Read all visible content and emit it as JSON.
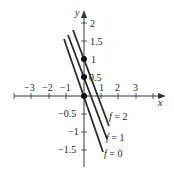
{
  "diagram": {
    "type": "level-curves",
    "axes": {
      "x_label": "x",
      "y_label": "y",
      "x_ticks": [
        "−3",
        "−2",
        "−1",
        "1",
        "2",
        "3"
      ],
      "y_ticks_pos": [
        "0.5",
        "1",
        "1.5",
        "2"
      ],
      "y_ticks_neg": [
        "−0.5",
        "−1",
        "−1.5"
      ]
    },
    "curves": [
      {
        "label_var": "f",
        "label_eq": " = 0"
      },
      {
        "label_var": "f",
        "label_eq": " = 1"
      },
      {
        "label_var": "f",
        "label_eq": " = 2"
      }
    ],
    "points": [
      {
        "x": 0,
        "y": 0
      },
      {
        "x": 0,
        "y": 0.5
      },
      {
        "x": 0,
        "y": 1
      }
    ],
    "colors": {
      "line": "#2b2b2b",
      "axis": "#333333"
    }
  }
}
